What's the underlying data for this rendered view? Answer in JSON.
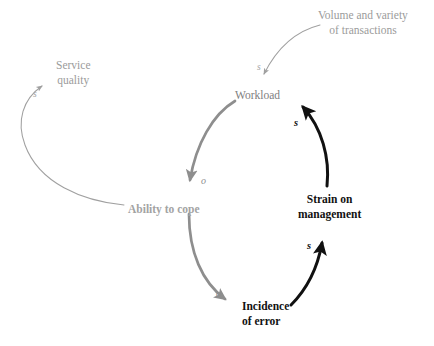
{
  "diagram": {
    "type": "causal-loop-diagram",
    "title": "",
    "background_color": "#ffffff",
    "palette": {
      "thin_gray": "#a0a0a0",
      "thick_gray": "#8e8e8e",
      "black": "#111111",
      "node_light_gray": "#9b9b9b",
      "node_medium_gray": "#7e7e7e",
      "node_cope_gray": "#a3a3a3",
      "node_black": "#111111"
    },
    "nodes": [
      {
        "id": "volume",
        "label_line1": "Volume and variety",
        "label_line2": "of transactions",
        "style": "light-gray",
        "bold": false,
        "x": 318,
        "y": 8
      },
      {
        "id": "workload",
        "label_line1": "Workload",
        "label_line2": "",
        "style": "medium-gray",
        "bold": false,
        "x": 235,
        "y": 88
      },
      {
        "id": "service_quality",
        "label_line1": "Service",
        "label_line2": "quality",
        "style": "light-gray",
        "bold": false,
        "x": 56,
        "y": 58
      },
      {
        "id": "ability_to_cope",
        "label_line1": "Ability to cope",
        "label_line2": "",
        "style": "cope-gray",
        "bold": true,
        "x": 128,
        "y": 202
      },
      {
        "id": "strain",
        "label_line1": "Strain on",
        "label_line2": "management",
        "style": "black",
        "bold": true,
        "x": 298,
        "y": 192
      },
      {
        "id": "incidence",
        "label_line1": "Incidence",
        "label_line2": "of error",
        "style": "black",
        "bold": true,
        "x": 242,
        "y": 299
      }
    ],
    "edges": [
      {
        "id": "volume-to-workload",
        "from": "volume",
        "to": "workload",
        "polarity": "s",
        "tag_x": 257,
        "tag_y": 62,
        "weight": "thin",
        "color": "#a0a0a0"
      },
      {
        "id": "workload-to-ability",
        "from": "workload",
        "to": "ability_to_cope",
        "polarity": "o",
        "tag_x": 201,
        "tag_y": 175,
        "weight": "thick",
        "color": "#8e8e8e"
      },
      {
        "id": "ability-to-incidence",
        "from": "ability_to_cope",
        "to": "incidence",
        "polarity": "o",
        "tag_x": 216,
        "tag_y": 288,
        "weight": "thick",
        "color": "#8e8e8e"
      },
      {
        "id": "ability-to-service-quality",
        "from": "ability_to_cope",
        "to": "service_quality",
        "polarity": "s",
        "tag_x": 33,
        "tag_y": 89,
        "weight": "thin",
        "color": "#a0a0a0"
      },
      {
        "id": "incidence-to-strain",
        "from": "incidence",
        "to": "strain",
        "polarity": "s",
        "tag_x": 307,
        "tag_y": 240,
        "weight": "thick",
        "color": "#111111"
      },
      {
        "id": "strain-to-workload",
        "from": "strain",
        "to": "workload",
        "polarity": "s",
        "tag_x": 294,
        "tag_y": 117,
        "weight": "thick",
        "color": "#111111"
      }
    ]
  }
}
